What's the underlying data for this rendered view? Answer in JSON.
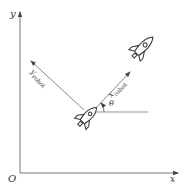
{
  "diagram": {
    "axes": {
      "origin_label": "O",
      "x_label": "x",
      "y_label": "y"
    },
    "robot_frame": {
      "x_axis_label": "x",
      "x_axis_subscript": "robot",
      "y_axis_label": "y",
      "y_axis_subscript": "robot",
      "heading_angle_label": "θ"
    },
    "icons": [
      {
        "name": "rocket-icon-robot",
        "role": "robot at current pose"
      },
      {
        "name": "rocket-icon-target",
        "role": "robot moving along x_robot"
      }
    ],
    "colors": {
      "line": "#555555",
      "text": "#333333",
      "background": "#ffffff"
    }
  }
}
